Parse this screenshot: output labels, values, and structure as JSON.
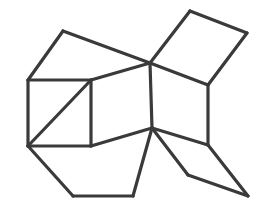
{
  "figure": {
    "canvas": {
      "width": 266,
      "height": 214,
      "background_color": "#ffffff"
    },
    "style": {
      "stroke_color": "#3a3a3a",
      "stroke_width": 3.2,
      "fill_color": "none"
    },
    "vertices": {
      "A": [
        63,
        31
      ],
      "B": [
        150,
        63
      ],
      "C": [
        28,
        80
      ],
      "D": [
        91,
        80
      ],
      "T": [
        190,
        11
      ],
      "R": [
        247,
        33
      ],
      "E": [
        208,
        85
      ],
      "F": [
        91,
        146
      ],
      "G": [
        28,
        146
      ],
      "H": [
        73,
        196
      ],
      "I": [
        133,
        196
      ],
      "J": [
        152,
        128
      ],
      "K": [
        208,
        145
      ],
      "L": [
        188,
        175
      ],
      "M": [
        248,
        196
      ]
    },
    "edges": [
      {
        "name": "upper-left-rhombus-top",
        "from": "A",
        "to": "B"
      },
      {
        "name": "upper-left-rhombus-left",
        "from": "A",
        "to": "C"
      },
      {
        "name": "upper-left-rhombus-bottom",
        "from": "C",
        "to": "D"
      },
      {
        "name": "upper-left-rhombus-right",
        "from": "D",
        "to": "B"
      },
      {
        "name": "top-right-rhombus-left",
        "from": "B",
        "to": "T"
      },
      {
        "name": "top-right-rhombus-top",
        "from": "T",
        "to": "R"
      },
      {
        "name": "top-right-rhombus-right",
        "from": "R",
        "to": "E"
      },
      {
        "name": "top-right-rhombus-bottom",
        "from": "E",
        "to": "B"
      },
      {
        "name": "square-left",
        "from": "C",
        "to": "G"
      },
      {
        "name": "square-bottom",
        "from": "G",
        "to": "F"
      },
      {
        "name": "square-right",
        "from": "F",
        "to": "D"
      },
      {
        "name": "square-diagonal",
        "from": "G",
        "to": "D"
      },
      {
        "name": "center-face-right",
        "from": "B",
        "to": "J"
      },
      {
        "name": "center-face-bottom",
        "from": "J",
        "to": "F"
      },
      {
        "name": "right-vertical",
        "from": "E",
        "to": "K"
      },
      {
        "name": "right-face-diagonal",
        "from": "J",
        "to": "K"
      },
      {
        "name": "bottom-left-edge",
        "from": "G",
        "to": "H"
      },
      {
        "name": "bottom-edge",
        "from": "H",
        "to": "I"
      },
      {
        "name": "bottom-rhombus-right",
        "from": "I",
        "to": "J"
      },
      {
        "name": "bottom-right-upper",
        "from": "J",
        "to": "L"
      },
      {
        "name": "bottom-right-lower",
        "from": "L",
        "to": "M"
      },
      {
        "name": "right-tip-edge",
        "from": "K",
        "to": "M"
      }
    ],
    "faces": [
      {
        "name": "upper-left-face",
        "path": "A B D C"
      },
      {
        "name": "top-right-face",
        "path": "B T R E"
      },
      {
        "name": "left-square-face",
        "path": "C D F G"
      },
      {
        "name": "center-face",
        "path": "D B J F"
      },
      {
        "name": "right-face",
        "path": "B E K J"
      },
      {
        "name": "bottom-face",
        "path": "G F J I H"
      },
      {
        "name": "bottom-right-face",
        "path": "J K M L"
      }
    ]
  }
}
